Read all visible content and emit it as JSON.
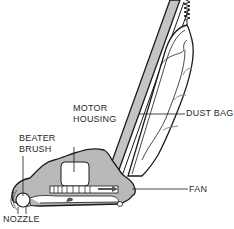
{
  "diagram": {
    "labels": {
      "motor_housing_line1": "MOTOR",
      "motor_housing_line2": "HOUSING",
      "dust_bag": "DUST BAG",
      "beater_brush_line1": "BEATER",
      "beater_brush_line2": "BRUSH",
      "fan": "FAN",
      "nozzle": "NOZZLE"
    },
    "colors": {
      "body_fill": "#b9b9b9",
      "outline": "#1a1a1a",
      "housing_fill": "#ffffff",
      "handle_fill": "#c4c4c4",
      "label_text": "#2a2a2a"
    }
  }
}
